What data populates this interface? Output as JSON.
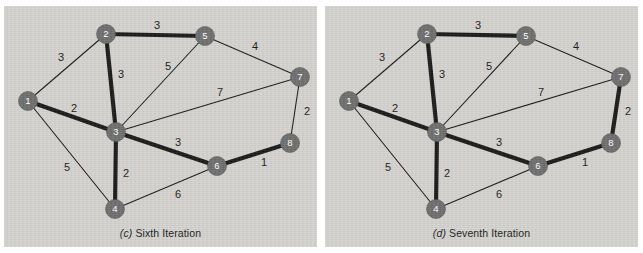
{
  "figure": {
    "background": "#ffffff",
    "panel_background": "#d4d3cf",
    "node_color": "#6e6e6e",
    "node_label_color": "#ffffff",
    "edge_color": "#1a1a1a",
    "edge_thin_width": 1.1,
    "edge_thick_width": 4.2,
    "label_color": "#1a1a1a"
  },
  "panels": [
    {
      "id": "c",
      "caption_index": "(c)",
      "caption_text": "Sixth Iteration",
      "nodes": [
        {
          "id": "1",
          "label": "1",
          "x": 24,
          "y": 95
        },
        {
          "id": "2",
          "label": "2",
          "x": 102,
          "y": 28
        },
        {
          "id": "3",
          "label": "3",
          "x": 112,
          "y": 126
        },
        {
          "id": "4",
          "label": "4",
          "x": 111,
          "y": 203
        },
        {
          "id": "5",
          "label": "5",
          "x": 201,
          "y": 30
        },
        {
          "id": "6",
          "label": "6",
          "x": 213,
          "y": 160
        },
        {
          "id": "7",
          "label": "7",
          "x": 296,
          "y": 71
        },
        {
          "id": "8",
          "label": "8",
          "x": 286,
          "y": 137
        }
      ],
      "edges": [
        {
          "from": "1",
          "to": "2",
          "weight": "3",
          "thick": false,
          "lx": 57,
          "ly": 52
        },
        {
          "from": "1",
          "to": "3",
          "weight": "2",
          "thick": true,
          "lx": 70,
          "ly": 103
        },
        {
          "from": "1",
          "to": "4",
          "weight": "5",
          "thick": false,
          "lx": 63,
          "ly": 162
        },
        {
          "from": "2",
          "to": "3",
          "weight": "3",
          "thick": true,
          "lx": 117,
          "ly": 69
        },
        {
          "from": "2",
          "to": "5",
          "weight": "3",
          "thick": true,
          "lx": 153,
          "ly": 20
        },
        {
          "from": "3",
          "to": "4",
          "weight": "2",
          "thick": true,
          "lx": 122,
          "ly": 168
        },
        {
          "from": "3",
          "to": "5",
          "weight": "5",
          "thick": false,
          "lx": 164,
          "ly": 61
        },
        {
          "from": "3",
          "to": "6",
          "weight": "3",
          "thick": true,
          "lx": 174,
          "ly": 137
        },
        {
          "from": "3",
          "to": "7",
          "weight": "7",
          "thick": false,
          "lx": 216,
          "ly": 87
        },
        {
          "from": "4",
          "to": "6",
          "weight": "6",
          "thick": false,
          "lx": 174,
          "ly": 189
        },
        {
          "from": "5",
          "to": "7",
          "weight": "4",
          "thick": false,
          "lx": 251,
          "ly": 41
        },
        {
          "from": "6",
          "to": "8",
          "weight": "1",
          "thick": true,
          "lx": 260,
          "ly": 157
        },
        {
          "from": "7",
          "to": "8",
          "weight": "2",
          "thick": false,
          "lx": 303,
          "ly": 106
        }
      ]
    },
    {
      "id": "d",
      "caption_index": "(d)",
      "caption_text": "Seventh Iteration",
      "nodes": [
        {
          "id": "1",
          "label": "1",
          "x": 24,
          "y": 95
        },
        {
          "id": "2",
          "label": "2",
          "x": 102,
          "y": 28
        },
        {
          "id": "3",
          "label": "3",
          "x": 112,
          "y": 126
        },
        {
          "id": "4",
          "label": "4",
          "x": 111,
          "y": 203
        },
        {
          "id": "5",
          "label": "5",
          "x": 201,
          "y": 30
        },
        {
          "id": "6",
          "label": "6",
          "x": 213,
          "y": 160
        },
        {
          "id": "7",
          "label": "7",
          "x": 296,
          "y": 71
        },
        {
          "id": "8",
          "label": "8",
          "x": 286,
          "y": 137
        }
      ],
      "edges": [
        {
          "from": "1",
          "to": "2",
          "weight": "3",
          "thick": false,
          "lx": 57,
          "ly": 52
        },
        {
          "from": "1",
          "to": "3",
          "weight": "2",
          "thick": true,
          "lx": 70,
          "ly": 103
        },
        {
          "from": "1",
          "to": "4",
          "weight": "5",
          "thick": false,
          "lx": 63,
          "ly": 162
        },
        {
          "from": "2",
          "to": "3",
          "weight": "3",
          "thick": true,
          "lx": 117,
          "ly": 69
        },
        {
          "from": "2",
          "to": "5",
          "weight": "3",
          "thick": true,
          "lx": 153,
          "ly": 20
        },
        {
          "from": "3",
          "to": "4",
          "weight": "2",
          "thick": true,
          "lx": 122,
          "ly": 168
        },
        {
          "from": "3",
          "to": "5",
          "weight": "5",
          "thick": false,
          "lx": 164,
          "ly": 61
        },
        {
          "from": "3",
          "to": "6",
          "weight": "3",
          "thick": true,
          "lx": 174,
          "ly": 137
        },
        {
          "from": "3",
          "to": "7",
          "weight": "7",
          "thick": false,
          "lx": 216,
          "ly": 87
        },
        {
          "from": "4",
          "to": "6",
          "weight": "6",
          "thick": false,
          "lx": 174,
          "ly": 189
        },
        {
          "from": "5",
          "to": "7",
          "weight": "4",
          "thick": false,
          "lx": 251,
          "ly": 41
        },
        {
          "from": "6",
          "to": "8",
          "weight": "1",
          "thick": true,
          "lx": 260,
          "ly": 157
        },
        {
          "from": "7",
          "to": "8",
          "weight": "2",
          "thick": true,
          "lx": 303,
          "ly": 106
        }
      ]
    }
  ]
}
